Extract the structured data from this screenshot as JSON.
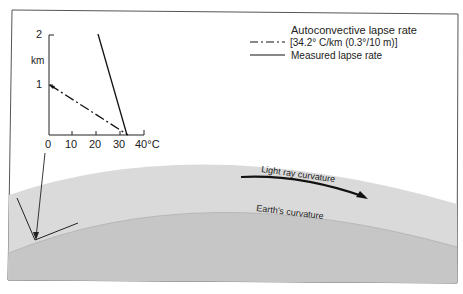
{
  "diagram": {
    "type": "atmospheric refraction diagram",
    "inset_plot": {
      "y_axis": {
        "unit_label": "km",
        "ticks": [
          "1",
          "2"
        ]
      },
      "x_axis": {
        "ticks": [
          "0",
          "10",
          "20",
          "30",
          "40°C"
        ]
      },
      "series": [
        {
          "name": "Autoconvective lapse rate",
          "style": "dash-dot",
          "points": [
            [
              0,
              1.0
            ],
            [
              34.2,
              0
            ]
          ]
        },
        {
          "name": "Measured lapse rate",
          "style": "solid",
          "points": [
            [
              21,
              2.0
            ],
            [
              35,
              0
            ]
          ]
        }
      ]
    },
    "legend": {
      "autoconvective_label": "Autoconvective lapse rate",
      "autoconvective_detail": "[34.2° C/km (0.3°/10 m)]",
      "measured_label": "Measured lapse rate"
    },
    "labels": {
      "light_ray": "Light ray curvature",
      "earth": "Earth's curvature"
    },
    "colors": {
      "background": "#ffffff",
      "atmosphere": "#d9d9d9",
      "earth": "#c4c4c4",
      "ink": "#222222"
    }
  }
}
